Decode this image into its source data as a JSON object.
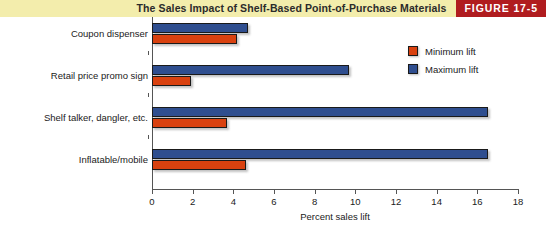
{
  "header": {
    "title": "The Sales Impact of Shelf-Based Point-of-Purchase Materials",
    "badge": "FIGURE 17-5",
    "band_color": "#f3edac",
    "badge_color": "#b01c1f"
  },
  "chart_data": {
    "type": "bar",
    "orientation": "horizontal",
    "title": "The Sales Impact of Shelf-Based Point-of-Purchase Materials",
    "categories": [
      "Coupon dispenser",
      "Retail price promo sign",
      "Shelf talker, dangler, etc.",
      "Inflatable/mobile"
    ],
    "series": [
      {
        "name": "Minimum lift",
        "color": "#d9410f",
        "values": [
          4.2,
          1.9,
          3.7,
          4.6
        ]
      },
      {
        "name": "Maximum lift",
        "color": "#2f4e8f",
        "values": [
          4.7,
          9.7,
          16.5,
          16.5
        ]
      }
    ],
    "xlabel": "Percent sales lift",
    "ylabel": "",
    "xlim": [
      0,
      18
    ],
    "xticks": [
      0,
      2,
      4,
      6,
      8,
      10,
      12,
      14,
      16,
      18
    ],
    "xtick_labels": [
      "0",
      "2",
      "4",
      "6",
      "8",
      "10",
      "12",
      "14",
      "16",
      "18"
    ],
    "grid": false,
    "legend_position": "top-right"
  },
  "legend": {
    "items": [
      {
        "label": "Minimum lift",
        "color": "#d9410f"
      },
      {
        "label": "Maximum lift",
        "color": "#2f4e8f"
      }
    ]
  }
}
